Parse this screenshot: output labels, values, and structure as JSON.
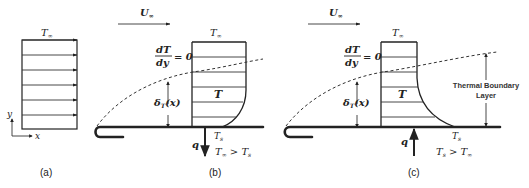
{
  "figure": {
    "panels": {
      "a": {
        "caption": "(a)",
        "freestream_label": "T",
        "freestream_sub": "∞",
        "axis_y": "y",
        "axis_x": "x"
      },
      "b": {
        "caption": "(b)",
        "velocity_label": "U",
        "velocity_sub": "∞",
        "top_label": "T",
        "top_sub": "∞",
        "gradient_num": "dT",
        "gradient_den": "dy",
        "gradient_eq": "= 0",
        "delta_label": "δ",
        "delta_sub": "T",
        "delta_arg": "(x)",
        "profile_label": "T",
        "surface_label": "T",
        "surface_sub": "s",
        "heat_label": "q",
        "heat_direction": "down",
        "condition_lhs": "T",
        "condition_lhs_sub": "∞",
        "condition_op": " > ",
        "condition_rhs": "T",
        "condition_rhs_sub": "s"
      },
      "c": {
        "caption": "(c)",
        "velocity_label": "U",
        "velocity_sub": "∞",
        "top_label": "T",
        "top_sub": "∞",
        "gradient_num": "dT",
        "gradient_den": "dy",
        "gradient_eq": "= 0",
        "delta_label": "δ",
        "delta_sub": "T",
        "delta_arg": "(x)",
        "profile_label": "T",
        "surface_label": "T",
        "surface_sub": "s",
        "heat_label": "q",
        "heat_direction": "up",
        "condition_lhs": "T",
        "condition_lhs_sub": "s",
        "condition_op": " > ",
        "condition_rhs": "T",
        "condition_rhs_sub": "∞",
        "annotation_line1": "Thermal Boundary",
        "annotation_line2": "Layer"
      }
    }
  }
}
